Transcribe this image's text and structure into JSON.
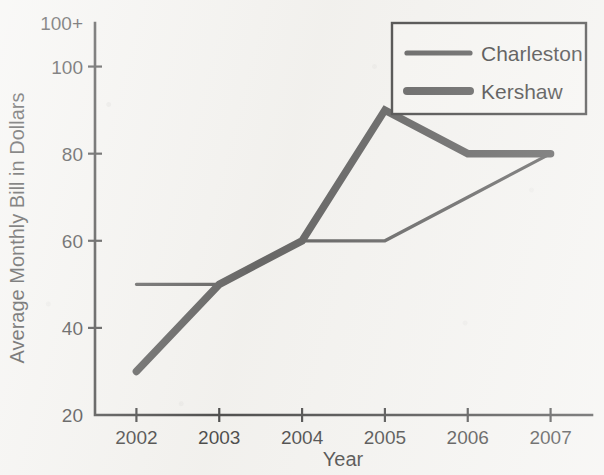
{
  "chart_data": {
    "type": "line",
    "title": "",
    "subtitle": "",
    "xlabel": "Year",
    "ylabel": "Average Monthly Bill in Dollars",
    "categories": [
      "2002",
      "2003",
      "2004",
      "2005",
      "2006",
      "2007"
    ],
    "x": [
      2002,
      2003,
      2004,
      2005,
      2006,
      2007
    ],
    "series": [
      {
        "name": "Charleston",
        "values": [
          50,
          50,
          60,
          60,
          70,
          80
        ],
        "style": "thin-line",
        "color": "#3a3a3a",
        "stroke_width": 3.2
      },
      {
        "name": "Kershaw",
        "values": [
          30,
          50,
          60,
          90,
          80,
          80
        ],
        "style": "thick-line",
        "color": "#3a3a3a",
        "stroke_width": 7.5
      }
    ],
    "ylim": [
      20,
      110
    ],
    "yticks": [
      20,
      40,
      60,
      80,
      100,
      110
    ],
    "ytick_labels": [
      "20",
      "40",
      "60",
      "80",
      "100",
      "100+"
    ],
    "grid": false,
    "legend": {
      "position": "top-right",
      "entries": [
        "Charleston",
        "Kershaw"
      ]
    }
  },
  "axes": {
    "y_title": "Average Monthly Bill in Dollars",
    "x_title": "Year",
    "y_ticks": [
      {
        "value": 110,
        "label": "100+"
      },
      {
        "value": 100,
        "label": "100"
      },
      {
        "value": 80,
        "label": "80"
      },
      {
        "value": 60,
        "label": "60"
      },
      {
        "value": 40,
        "label": "40"
      },
      {
        "value": 20,
        "label": "20"
      }
    ],
    "x_ticks": [
      {
        "value": 2002,
        "label": "2002"
      },
      {
        "value": 2003,
        "label": "2003"
      },
      {
        "value": 2004,
        "label": "2004"
      },
      {
        "value": 2005,
        "label": "2005"
      },
      {
        "value": 2006,
        "label": "2006"
      },
      {
        "value": 2007,
        "label": "2007"
      }
    ]
  },
  "legend": {
    "entry_charleston": "Charleston",
    "entry_kershaw": "Kershaw"
  },
  "colors": {
    "ink": "#1c1c1c",
    "line": "#3a3a3a",
    "paper": "#f2f1ee",
    "legend_fill": "#f5f4f1"
  }
}
